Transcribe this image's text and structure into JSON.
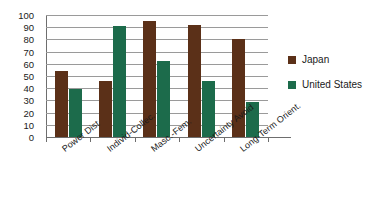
{
  "chart_data": {
    "type": "bar",
    "title": "",
    "subtitle": "",
    "xlabel": "",
    "ylabel": "",
    "ylim": [
      0,
      100
    ],
    "ytick_step": 10,
    "yticks": [
      100,
      90,
      80,
      70,
      60,
      50,
      40,
      30,
      20,
      10,
      0
    ],
    "grid": true,
    "legend_position": "right",
    "categories": [
      "Power Dist",
      "Individ-Collec.",
      "Masc.-Fem.",
      "Uncertainty Avoid",
      "Long-Term Orient."
    ],
    "series": [
      {
        "name": "Japan",
        "color": "#5b3018",
        "values": [
          54,
          46,
          95,
          92,
          80
        ]
      },
      {
        "name": "United States",
        "color": "#1c6b4b",
        "values": [
          39,
          91,
          62,
          46,
          29
        ]
      }
    ]
  },
  "legend": {
    "items": [
      {
        "label": "Japan",
        "color": "#5b3018"
      },
      {
        "label": "United States",
        "color": "#1c6b4b"
      }
    ]
  },
  "colors": {
    "japan": "#5b3018",
    "united_states": "#1c6b4b",
    "gridline": "#9a9a9a",
    "axis": "#6e6e6e",
    "text": "#1a1a1a",
    "background": "#ffffff"
  }
}
